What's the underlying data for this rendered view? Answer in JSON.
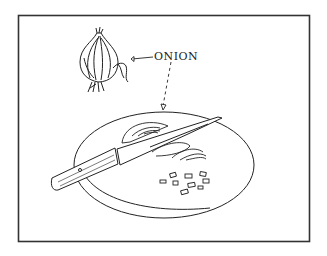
{
  "illustration": {
    "subject": "Onion being sliced on a cutting board with a knife",
    "label": "ONION",
    "colors": {
      "ink": "#222222",
      "background": "#ffffff"
    }
  }
}
